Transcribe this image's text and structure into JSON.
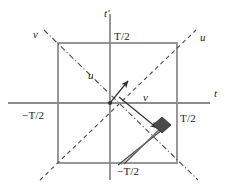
{
  "figure": {
    "width": 228,
    "height": 187
  },
  "colors": {
    "axis": "#8c8c8c",
    "box": "#8c8c8c",
    "dashed_diagonal": "#4a4a4a",
    "dashdot_diagonal": "#4a4a4a",
    "vector": "#333333",
    "marker_fill": "#4a4a4a",
    "tube": "#4a4a4a",
    "text": "#222222",
    "background": "#ffffff"
  },
  "axes": {
    "horizontal": {
      "name": "t-axis",
      "label": "t",
      "y": 103,
      "x_start": 8,
      "x_end": 210
    },
    "vertical": {
      "name": "t-prime-axis",
      "label": "t'",
      "x": 110,
      "y_start": 14,
      "y_end": 180
    }
  },
  "tick_labels": {
    "top": "T/2",
    "right": "T/2",
    "left": "−T/2",
    "bottom": "−T/2"
  },
  "box": {
    "name": "square-region",
    "left": 58,
    "top": 43,
    "right": 177,
    "bottom": 163
  },
  "diagonals": [
    {
      "name": "u-diagonal",
      "label": "u",
      "style": "dashed",
      "from": [
        40,
        180
      ],
      "to": [
        196,
        30
      ]
    },
    {
      "name": "v-diagonal",
      "label": "v",
      "style": "dash-dot",
      "from": [
        44,
        30
      ],
      "to": [
        198,
        180
      ]
    }
  ],
  "vectors": [
    {
      "name": "u-vector",
      "label": "u",
      "from": [
        110,
        103
      ],
      "to": [
        130,
        79
      ]
    },
    {
      "name": "v-vector",
      "label": "v",
      "from": [
        118,
        96
      ],
      "to": [
        159,
        130
      ]
    }
  ],
  "marker": {
    "name": "event-marker",
    "shape": "filled-diamond",
    "center": [
      162,
      125
    ]
  },
  "tube": {
    "name": "worldtube-strip",
    "from": [
      168,
      119
    ],
    "to": [
      122,
      164
    ]
  },
  "origin": {
    "name": "origin-point",
    "x": 110,
    "y": 103
  }
}
